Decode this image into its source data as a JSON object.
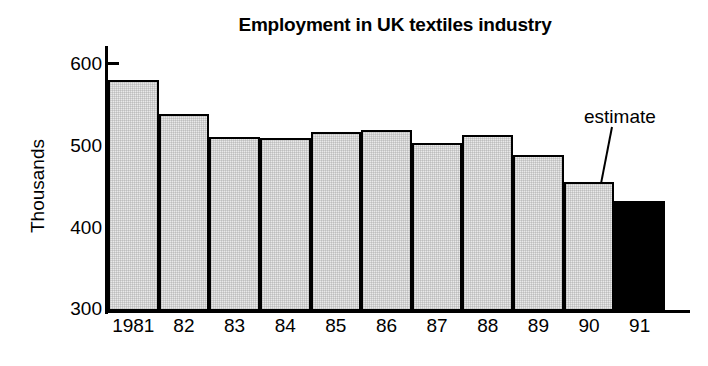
{
  "chart_data": {
    "type": "bar",
    "title": "Employment in UK textiles industry",
    "xlabel": "",
    "ylabel": "Thousands",
    "categories": [
      "1981",
      "82",
      "83",
      "84",
      "85",
      "86",
      "87",
      "88",
      "89",
      "90",
      "91"
    ],
    "values": [
      578,
      537,
      510,
      508,
      516,
      518,
      503,
      512,
      488,
      455,
      432
    ],
    "ylim": [
      300,
      600
    ],
    "yticks": [
      300,
      400,
      500,
      600
    ],
    "ytick_labels": [
      "300",
      "400",
      "500",
      "600"
    ],
    "grid": false,
    "legend": null,
    "annotations": [
      {
        "text": "estimate",
        "target_category": "91",
        "note": "leader line pointing to the 1991 bar"
      }
    ],
    "series_styles": [
      {
        "name": "actual",
        "categories": [
          "1981",
          "82",
          "83",
          "84",
          "85",
          "86",
          "87",
          "88",
          "89",
          "90"
        ],
        "fill": "#e9e9e9",
        "edge": "#000000"
      },
      {
        "name": "estimate",
        "categories": [
          "91"
        ],
        "fill": "#000000",
        "edge": "#000000"
      }
    ]
  },
  "figure": {
    "title": "Employment in UK textiles industry",
    "y_axis_title": "Thousands",
    "estimate_note": "estimate",
    "caption_fragment": ""
  },
  "colors": {
    "bar_fill": "#e9e9e9",
    "bar_estimate_fill": "#000000",
    "axis": "#000000",
    "text": "#000000",
    "background": "#ffffff"
  }
}
